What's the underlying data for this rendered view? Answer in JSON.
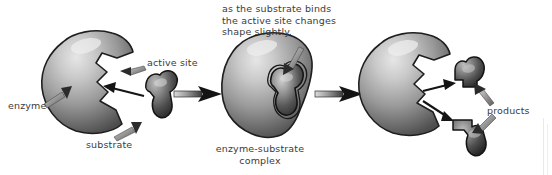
{
  "figure": {
    "background_color": "#ffffff",
    "ink_color": "#3b3b3b",
    "width": 552,
    "height": 175
  },
  "labels": {
    "callout_binding": "as the substrate binds\nthe active site changes\nshape slightly.",
    "active_site": "active site",
    "enzyme": "enzyme",
    "substrate": "substrate",
    "complex": "enzyme-substrate\ncomplex",
    "products": "products"
  },
  "stages": [
    {
      "index": 1,
      "name": "free-enzyme-and-substrate",
      "parts": [
        "enzyme",
        "substrate"
      ],
      "labels": [
        "enzyme",
        "active site",
        "substrate"
      ]
    },
    {
      "index": 2,
      "name": "enzyme-substrate-complex",
      "parts": [
        "enzyme",
        "bound substrate"
      ],
      "labels": [
        "enzyme-substrate complex",
        "as the substrate binds the active site changes shape slightly."
      ]
    },
    {
      "index": 3,
      "name": "products-released",
      "parts": [
        "enzyme",
        "product piece 1",
        "product piece 2"
      ],
      "labels": [
        "products"
      ]
    }
  ],
  "colors": {
    "enzyme_light": "#d8d8d8",
    "enzyme_mid": "#8e8e8e",
    "enzyme_dark": "#4a4a4a",
    "substrate_light": "#b8b8b8",
    "substrate_dark": "#2a2a2a",
    "outline": "#1e1e1e",
    "arrow": "#1a1a1a",
    "text": "#3b3b3b"
  },
  "arrows": {
    "reaction_arrow_1": "enzyme + substrate to complex",
    "reaction_arrow_2": "complex to products",
    "pointer_active_site": "points to notch of first enzyme",
    "pointer_enzyme": "points to body of first enzyme",
    "pointer_substrate": "points to substrate blob",
    "pointer_binding_note": "points to bound substrate in complex",
    "pointer_products_upper": "points to upper product piece",
    "pointer_products_lower": "points to lower product piece",
    "release_arrow_upper": "from active site to upper product",
    "release_arrow_lower": "from active site to lower product"
  }
}
